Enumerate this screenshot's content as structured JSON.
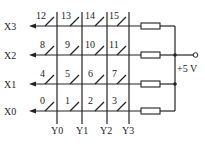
{
  "diagram": {
    "title": "",
    "rows": [
      {
        "label": "X3",
        "keys": [
          "12",
          "13",
          "14",
          "15"
        ]
      },
      {
        "label": "X2",
        "keys": [
          "8",
          "9",
          "10",
          "11"
        ]
      },
      {
        "label": "X1",
        "keys": [
          "4",
          "5",
          "6",
          "7"
        ]
      },
      {
        "label": "X0",
        "keys": [
          "0",
          "1",
          "2",
          "3"
        ]
      }
    ],
    "columns": [
      "Y0",
      "Y1",
      "Y2",
      "Y3"
    ],
    "supply_label": "+5 V",
    "colors": {
      "line": "#222222",
      "background": "#ffffff"
    }
  }
}
